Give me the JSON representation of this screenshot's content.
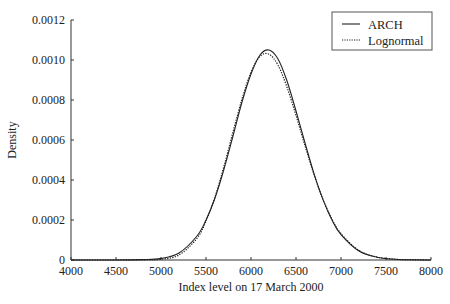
{
  "chart_data": {
    "type": "line",
    "title": "",
    "xlabel": "Index level on 17 March 2000",
    "ylabel": "Density",
    "xlim": [
      4000,
      8000
    ],
    "ylim": [
      0,
      0.0012
    ],
    "grid": false,
    "legend_position": "top-right",
    "x_ticks": [
      4000,
      4500,
      5000,
      5500,
      6000,
      6500,
      7000,
      7500,
      8000
    ],
    "y_ticks": [
      0,
      0.0002,
      0.0004,
      0.0006,
      0.0008,
      0.001,
      0.0012
    ],
    "x_tick_labels": [
      "4000",
      "4500",
      "5000",
      "5500",
      "6000",
      "6500",
      "7000",
      "7500",
      "8000"
    ],
    "y_tick_labels": [
      "0",
      "0.0002",
      "0.0004",
      "0.0006",
      "0.0008",
      "0.0010",
      "0.0012"
    ],
    "x": [
      4000,
      4400,
      4800,
      5000,
      5200,
      5400,
      5500,
      5600,
      5700,
      5800,
      5900,
      6000,
      6100,
      6200,
      6300,
      6400,
      6500,
      6600,
      6700,
      6800,
      6900,
      7000,
      7200,
      7400,
      7600,
      7800,
      8000
    ],
    "series": [
      {
        "name": "ARCH",
        "style": "solid",
        "values": [
          0,
          1e-07,
          2e-06,
          8e-06,
          3.5e-05,
          0.00012,
          0.0002,
          0.00031,
          0.000455,
          0.00062,
          0.00079,
          0.00093,
          0.001025,
          0.00105,
          0.001005,
          0.000895,
          0.000745,
          0.000585,
          0.000432,
          0.000302,
          0.0002,
          0.000127,
          4.5e-05,
          1.4e-05,
          4e-06,
          1e-06,
          0
        ]
      },
      {
        "name": "Lognormal",
        "style": "dotted",
        "values": [
          0,
          0,
          3e-07,
          3.7e-06,
          2.51e-05,
          0.0001085,
          0.000194,
          0.000315,
          0.000469,
          0.00064,
          0.000805,
          0.000939,
          0.001018,
          0.001029,
          0.000974,
          0.000864,
          0.000723,
          0.000571,
          0.000427,
          0.000303,
          0.000204,
          0.0001315,
          4.75e-05,
          1.45e-05,
          3.8e-06,
          9e-07,
          0
        ]
      }
    ]
  },
  "legend": {
    "items": [
      {
        "label": "ARCH",
        "style": "solid"
      },
      {
        "label": "Lognormal",
        "style": "dotted"
      }
    ]
  },
  "axes": {
    "x_title": "Index level on 17 March 2000",
    "y_title": "Density"
  }
}
